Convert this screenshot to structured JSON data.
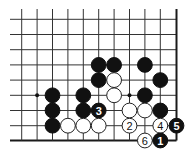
{
  "board": {
    "width": 194,
    "height": 155,
    "columns_x": [
      21.7,
      37.1,
      52.5,
      67.9,
      83.3,
      98.7,
      114.1,
      129.5,
      144.9,
      160.3,
      176.5
    ],
    "rows_y": [
      19.3,
      34.5,
      49.7,
      64.9,
      80.1,
      95.3,
      110.5,
      125.7,
      140.5
    ],
    "line_extent": {
      "left": 10,
      "top": 9,
      "right_edge_col": 10,
      "bottom_edge_row": 8
    },
    "stone_radius": 7.4,
    "colors": {
      "black": "#111111",
      "white": "#ffffff",
      "line": "#333333"
    }
  },
  "star_points": [
    {
      "col": 1,
      "row": 5
    },
    {
      "col": 7,
      "row": 5
    }
  ],
  "stones": [
    {
      "color": "black",
      "col": 5,
      "row": 3
    },
    {
      "color": "black",
      "col": 6,
      "row": 3
    },
    {
      "color": "black",
      "col": 8,
      "row": 3
    },
    {
      "color": "black",
      "col": 5,
      "row": 4
    },
    {
      "color": "white",
      "col": 6,
      "row": 4
    },
    {
      "color": "black",
      "col": 9,
      "row": 4
    },
    {
      "color": "black",
      "col": 2,
      "row": 5
    },
    {
      "color": "black",
      "col": 4,
      "row": 5
    },
    {
      "color": "white",
      "col": 6,
      "row": 5
    },
    {
      "color": "black",
      "col": 8,
      "row": 5
    },
    {
      "color": "black",
      "col": 2,
      "row": 6
    },
    {
      "color": "black",
      "col": 4,
      "row": 6
    },
    {
      "color": "black",
      "col": 5,
      "row": 6,
      "label": "3"
    },
    {
      "color": "white",
      "col": 7,
      "row": 6
    },
    {
      "color": "white",
      "col": 8,
      "row": 6
    },
    {
      "color": "black",
      "col": 9,
      "row": 6
    },
    {
      "color": "black",
      "col": 2,
      "row": 7
    },
    {
      "color": "white",
      "col": 3,
      "row": 7
    },
    {
      "color": "white",
      "col": 4,
      "row": 7
    },
    {
      "color": "white",
      "col": 5,
      "row": 7
    },
    {
      "color": "white",
      "col": 7,
      "row": 7,
      "label": "2"
    },
    {
      "color": "white",
      "col": 9,
      "row": 7,
      "label": "4"
    },
    {
      "color": "black",
      "col": 10,
      "row": 7,
      "label": "5"
    },
    {
      "color": "white",
      "col": 8,
      "row": 8,
      "label": "6"
    },
    {
      "color": "black",
      "col": 9,
      "row": 8,
      "label": "1"
    }
  ],
  "move_sequence": [
    "1",
    "2",
    "3",
    "4",
    "5",
    "6"
  ]
}
